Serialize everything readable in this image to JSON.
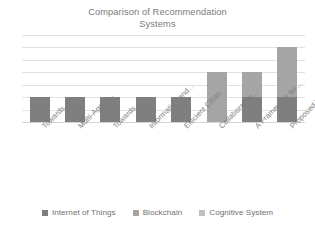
{
  "chart_data": {
    "type": "bar",
    "stacked": true,
    "title": "Comparison of Recommendation Systems",
    "title_lines": [
      "Comparison of Recommendation",
      "Systems"
    ],
    "xlabel": "",
    "ylabel": "",
    "ylim": [
      0,
      7
    ],
    "grid": true,
    "gridline_count": 7,
    "y_tick_labels": [],
    "legend_position": "bottom",
    "categories": [
      "Towards…",
      "Multi-Agent…",
      "Towards…",
      "Information and…",
      "Efficient CRan…",
      "Collaborative…",
      "A Framework for…",
      "Proposed Work"
    ],
    "series": [
      {
        "name": "Internet of Things",
        "color": "#7f7f7f",
        "values": [
          2,
          2,
          2,
          2,
          2,
          0,
          2,
          2
        ]
      },
      {
        "name": "Blockchain",
        "color": "#a5a5a5",
        "values": [
          0,
          0,
          0,
          0,
          0,
          4,
          2,
          4
        ]
      },
      {
        "name": "Cognitive System",
        "color": "#bfbfbf",
        "values": [
          0,
          0,
          0,
          0,
          0,
          0,
          0,
          0
        ]
      }
    ],
    "totals": [
      2,
      2,
      2,
      2,
      2,
      4,
      4,
      6
    ]
  },
  "legend": {
    "items": [
      {
        "label": "Internet of Things",
        "color": "#7f7f7f"
      },
      {
        "label": "Blockchain",
        "color": "#a5a5a5"
      },
      {
        "label": "Cognitive System",
        "color": "#bfbfbf"
      }
    ]
  },
  "colors": {
    "series_1": "#7f7f7f",
    "series_2": "#a5a5a5",
    "series_3": "#bfbfbf",
    "gridline": "#e2e2e2",
    "text": "#7b7b7b",
    "background": "#ffffff"
  }
}
